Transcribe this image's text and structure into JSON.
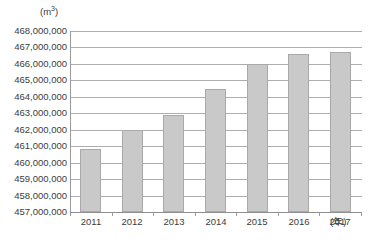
{
  "clipped_header": {
    "text": ""
  },
  "axis": {
    "y_unit": "(m",
    "y_unit_sup": "3",
    "y_unit_close": ")",
    "x_unit": "(年)"
  },
  "chart_data": {
    "type": "bar",
    "title": "",
    "xlabel": "年",
    "ylabel": "m3",
    "categories": [
      "2011",
      "2012",
      "2013",
      "2014",
      "2015",
      "2016",
      "2017"
    ],
    "values": [
      460800000,
      462000000,
      462900000,
      464500000,
      466000000,
      466600000,
      466700000
    ],
    "ylim": [
      457000000,
      468000000
    ],
    "ytick_labels": [
      "468,000,000",
      "467,000,000",
      "466,000,000",
      "465,000,000",
      "464,000,000",
      "463,000,000",
      "462,000,000",
      "461,000,000",
      "460,000,000",
      "459,000,000",
      "458,000,000",
      "457,000,000"
    ],
    "ytick_values": [
      468000000,
      467000000,
      466000000,
      465000000,
      464000000,
      463000000,
      462000000,
      461000000,
      460000000,
      459000000,
      458000000,
      457000000
    ],
    "grid": true,
    "legend": null,
    "series_color": "#c9c9c9",
    "grid_color": "#adadad"
  }
}
